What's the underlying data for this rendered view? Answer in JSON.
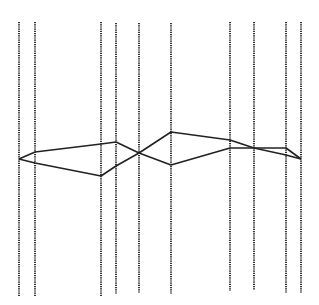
{
  "chart_data": {
    "type": "line",
    "subtype": "parallel-coordinates",
    "title": "",
    "xlabel": "",
    "ylabel": "",
    "legend": [],
    "grid": false,
    "axes": [
      {
        "x": 19,
        "top": 22,
        "bottom": 296
      },
      {
        "x": 35,
        "top": 22,
        "bottom": 296
      },
      {
        "x": 101,
        "top": 22,
        "bottom": 296
      },
      {
        "x": 116,
        "top": 23,
        "bottom": 294
      },
      {
        "x": 139,
        "top": 23,
        "bottom": 293
      },
      {
        "x": 171,
        "top": 23,
        "bottom": 294
      },
      {
        "x": 230,
        "top": 22,
        "bottom": 291
      },
      {
        "x": 254,
        "top": 22,
        "bottom": 290
      },
      {
        "x": 286,
        "top": 22,
        "bottom": 293
      },
      {
        "x": 301,
        "top": 22,
        "bottom": 293
      }
    ],
    "series": [
      {
        "name": "line-1",
        "values": [
          159,
          152,
          144,
          142,
          153,
          132,
          140,
          148,
          148,
          159
        ]
      },
      {
        "name": "line-2",
        "values": [
          159,
          163,
          176,
          166,
          153,
          165,
          148,
          148,
          155,
          159
        ]
      }
    ],
    "colors": {
      "axis": "#333333",
      "line": "#222222",
      "background": "#ffffff"
    }
  }
}
